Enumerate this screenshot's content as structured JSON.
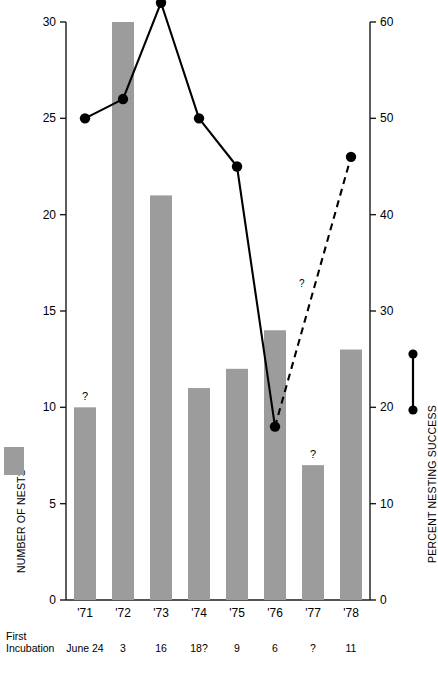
{
  "chart_data": {
    "type": "bar",
    "title": "",
    "subtitle": "",
    "categories": [
      "'71",
      "'72",
      "'73",
      "'74",
      "'75",
      "'76",
      "'77",
      "'78"
    ],
    "grid": false,
    "legend_position": "outside-left-and-right",
    "series": [
      {
        "name": "NUMBER OF NESTS",
        "type": "bar",
        "axis": "left",
        "color": "#9c9c9c",
        "values": [
          10,
          30,
          21,
          11,
          12,
          14,
          7,
          13
        ],
        "point_annotations": [
          "?",
          "",
          "",
          "",
          "",
          "",
          "?",
          ""
        ]
      },
      {
        "name": "PERCENT NESTING SUCCESS",
        "type": "line",
        "axis": "right",
        "color": "#000000",
        "values": [
          50,
          52,
          62,
          50,
          45,
          18,
          null,
          46
        ],
        "solid_through_index": 5,
        "dashed_from_index": 5,
        "dashed_to_index": 7,
        "dashed_annotation": "?"
      }
    ],
    "xlabel": "",
    "ylabel": "NUMBER OF NESTS",
    "ylabel_right": "PERCENT NESTING SUCCESS",
    "ylim": [
      0,
      30
    ],
    "ylim_right": [
      0,
      60
    ],
    "yticks": [
      0,
      5,
      10,
      15,
      20,
      25,
      30
    ],
    "yticks_right": [
      0,
      10,
      20,
      30,
      40,
      50,
      60
    ],
    "annotations": {
      "row_label_line1": "First",
      "row_label_line2": "Incubation",
      "row_values": [
        "June 24",
        "3",
        "16",
        "18?",
        "9",
        "6",
        "?",
        "11"
      ]
    }
  },
  "axes": {
    "left": {
      "title": "NUMBER OF NESTS",
      "ticks": [
        {
          "label": "30",
          "value": 30
        },
        {
          "label": "25",
          "value": 25
        },
        {
          "label": "20",
          "value": 20
        },
        {
          "label": "15",
          "value": 15
        },
        {
          "label": "10",
          "value": 10
        },
        {
          "label": "5",
          "value": 5
        },
        {
          "label": "0",
          "value": 0
        }
      ]
    },
    "right": {
      "title": "PERCENT NESTING SUCCESS",
      "ticks": [
        {
          "label": "60",
          "value": 60
        },
        {
          "label": "50",
          "value": 50
        },
        {
          "label": "40",
          "value": 40
        },
        {
          "label": "30",
          "value": 30
        },
        {
          "label": "20",
          "value": 20
        },
        {
          "label": "10",
          "value": 10
        },
        {
          "label": "0",
          "value": 0
        }
      ]
    },
    "x": {
      "ticks": [
        "'71",
        "'72",
        "'73",
        "'74",
        "'75",
        "'76",
        "'77",
        "'78"
      ]
    }
  },
  "colors": {
    "bar_fill": "#9c9c9c",
    "line": "#000000",
    "axis": "#1a1a1a",
    "background": "#ffffff"
  }
}
